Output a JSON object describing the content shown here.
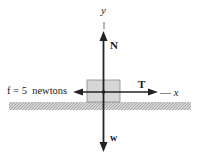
{
  "diagram": {
    "type": "free-body-diagram",
    "axes": {
      "y_label": "y",
      "x_label": "x",
      "x_prefix": "—"
    },
    "forces": {
      "normal": {
        "label": "N",
        "direction": "up"
      },
      "tension": {
        "label": "T",
        "direction": "right"
      },
      "weight": {
        "label": "w",
        "direction": "down"
      },
      "friction": {
        "label": "f = 5  newtons",
        "direction": "left"
      }
    },
    "colors": {
      "arrow": "#222222",
      "block_fill": "#d6d6d6",
      "block_stroke": "#8a8a8a",
      "ground": "#b8b8b8"
    }
  }
}
